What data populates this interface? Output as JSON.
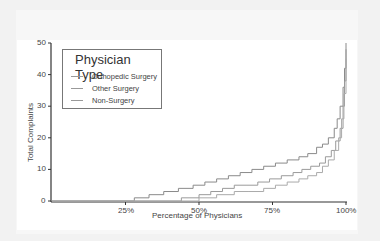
{
  "chart_data": {
    "type": "line",
    "subtype": "step",
    "title": "",
    "xlabel": "Percentage of Physicians",
    "ylabel": "Total Complaints",
    "xlim": [
      0,
      100
    ],
    "ylim": [
      0,
      50
    ],
    "x_ticks": [
      "25%",
      "50%",
      "75%",
      "100%"
    ],
    "y_ticks": [
      "0",
      "10",
      "20",
      "30",
      "40",
      "50"
    ],
    "grid": false,
    "legend": {
      "title": "Physician Type",
      "position": "upper left"
    },
    "series": [
      {
        "name": "Orthopedic Surgery",
        "color": "#8a8a8a",
        "x": [
          0,
          28,
          33,
          38,
          43,
          48,
          52,
          56,
          60,
          64,
          68,
          72,
          76,
          80,
          84,
          87,
          90,
          92,
          94,
          96,
          97,
          98,
          99,
          99.5,
          100
        ],
        "y": [
          0,
          1,
          2,
          3,
          4,
          5,
          6,
          7,
          8,
          9,
          10,
          11,
          12,
          13,
          14,
          15,
          17,
          18,
          20,
          23,
          26,
          30,
          36,
          42,
          50
        ]
      },
      {
        "name": "Other Surgery",
        "color": "#9a9a9a",
        "x": [
          0,
          44,
          50,
          54,
          58,
          62,
          66,
          70,
          74,
          78,
          82,
          85,
          88,
          91,
          93,
          95,
          96.5,
          98,
          99,
          99.5,
          100
        ],
        "y": [
          0,
          1,
          2,
          3,
          4,
          5,
          5,
          6,
          7,
          8,
          9,
          10,
          11,
          12,
          14,
          16,
          19,
          23,
          30,
          38,
          48
        ]
      },
      {
        "name": "Non-Surgery",
        "color": "#aaaaaa",
        "x": [
          0,
          50,
          56,
          62,
          67,
          72,
          76,
          80,
          84,
          87,
          90,
          92,
          94,
          96,
          97.5,
          98.5,
          99.3,
          100
        ],
        "y": [
          0,
          1,
          2,
          3,
          3,
          4,
          5,
          6,
          7,
          8,
          9,
          11,
          13,
          16,
          20,
          26,
          34,
          45
        ]
      }
    ]
  }
}
